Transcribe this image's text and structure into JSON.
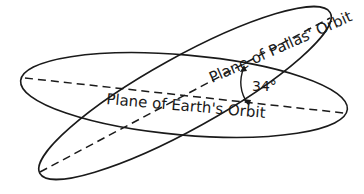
{
  "diagram": {
    "labels": {
      "pallas_plane": "Plane of Pallas' Orbit",
      "earth_plane": "Plane of Earth's Orbit",
      "angle": "34°"
    },
    "colors": {
      "line": "#1a1a1a",
      "background": "#ffffff"
    }
  }
}
